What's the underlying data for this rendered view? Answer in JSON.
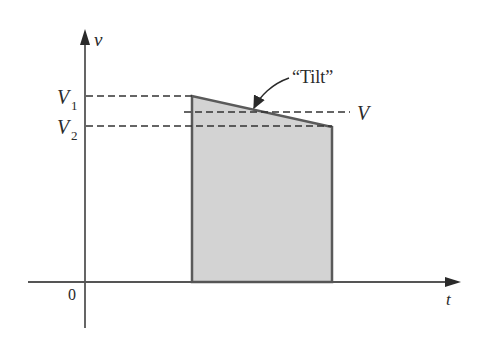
{
  "diagram": {
    "axes": {
      "y_label": "v",
      "x_label": "t",
      "origin_label": "0"
    },
    "levels": {
      "v1_label": "V",
      "v1_sub": "1",
      "v2_label": "V",
      "v2_sub": "2",
      "v_label": "V"
    },
    "annotation": {
      "tilt_label": "“Tilt”"
    },
    "colors": {
      "line": "#5a5a5a",
      "fill": "#d3d3d3",
      "dash": "#333333",
      "text": "#2a2a2a"
    }
  }
}
